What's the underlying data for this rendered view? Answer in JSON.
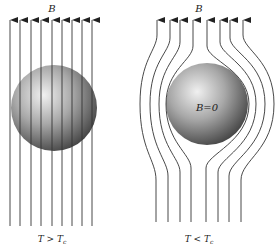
{
  "figure": {
    "left_panel": {
      "field_label": "B",
      "condition_label": "T > T",
      "condition_sub": "c",
      "line_count": 9,
      "line_x": [
        10,
        20,
        31,
        41,
        52,
        62,
        72,
        82,
        92
      ],
      "sphere": {
        "cx": 54,
        "cy": 108,
        "r": 43
      }
    },
    "right_panel": {
      "field_label": "B",
      "inside_label": "B=0",
      "condition_label": "T < T",
      "condition_sub": "c",
      "line_count": 8,
      "sphere": {
        "cx": 207,
        "cy": 104,
        "r": 41
      }
    },
    "colors": {
      "line": "#333333",
      "sphere_light": "#f2f2f2",
      "sphere_dark": "#3a3a3a"
    }
  }
}
